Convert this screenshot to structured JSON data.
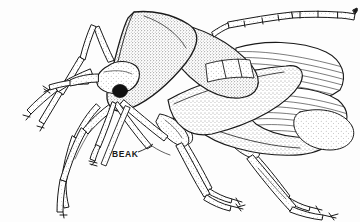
{
  "figure": {
    "view": "lateral",
    "background_color": "#fdfdfd",
    "ink_color": "#1a1a1a",
    "stipple_color": "#4a4a4a",
    "technique": "stippled pen-and-ink line drawing"
  },
  "annotations": [
    {
      "id": "beak",
      "label": "BEAK",
      "text_x": 112,
      "text_y": 154,
      "leader_from_x": 136,
      "leader_from_y": 151,
      "leader_to_x": 152,
      "leader_to_y": 145
    }
  ],
  "anatomy": {
    "head": "head-segment",
    "eye": "compound-eye",
    "antenna": "segmented-antenna",
    "pronotum": "pronotum-shield",
    "scutellum": "scutellum-triangle",
    "hemelytron": "hemelytron-forewing",
    "membrane": "wing-membrane-veined",
    "abdomen": "abdomen",
    "legs": [
      "foreleg-left",
      "foreleg-right",
      "midleg-left",
      "midleg-right",
      "hindleg-left",
      "hindleg-right"
    ],
    "rostrum": "beak-rostrum"
  }
}
